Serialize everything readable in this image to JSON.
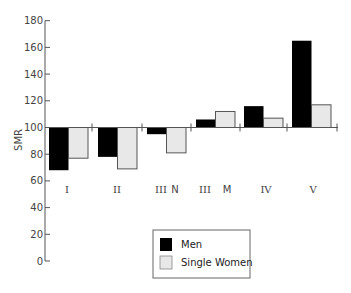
{
  "chart_data": {
    "type": "bar",
    "title": "",
    "xlabel": "",
    "ylabel": "SMR",
    "ylim": [
      0,
      180
    ],
    "yticks": [
      0,
      20,
      40,
      60,
      80,
      100,
      120,
      140,
      160,
      180
    ],
    "baseline": 100,
    "categories": [
      "I",
      "II",
      "III N",
      "III M",
      "IV",
      "V"
    ],
    "category_labels": [
      {
        "numeral": "I",
        "suffix": ""
      },
      {
        "numeral": "II",
        "suffix": ""
      },
      {
        "numeral": "III",
        "suffix": "N"
      },
      {
        "numeral": "III",
        "suffix": "M"
      },
      {
        "numeral": "IV",
        "suffix": ""
      },
      {
        "numeral": "V",
        "suffix": ""
      }
    ],
    "series": [
      {
        "name": "Men",
        "color": "#000000",
        "values": [
          68,
          78,
          95,
          106,
          116,
          165
        ]
      },
      {
        "name": "Single Women",
        "color": "#e8e8e8",
        "values": [
          77,
          69,
          81,
          112,
          107,
          117
        ]
      }
    ],
    "legend": {
      "position": "bottom-center",
      "entries": [
        "Men",
        "Single Women"
      ]
    },
    "grid": false
  }
}
